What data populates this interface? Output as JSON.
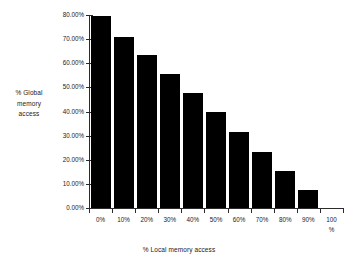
{
  "chart_data": {
    "type": "bar",
    "title": "",
    "xlabel": "% Local memory access",
    "ylabel": "% Global memory access",
    "ylabel_lines": [
      "% Global",
      "memory",
      "access"
    ],
    "categories": [
      "0%",
      "10%",
      "20%",
      "30%",
      "40%",
      "50%",
      "60%",
      "70%",
      "80%",
      "90%",
      "100\n%"
    ],
    "values": [
      79.7,
      71.0,
      63.5,
      55.5,
      47.7,
      39.6,
      31.7,
      23.4,
      15.5,
      7.5,
      0
    ],
    "ylim": [
      0,
      80
    ],
    "ytick_labels": [
      "0.00%",
      "10.00%",
      "20.00%",
      "30.00%",
      "40.00%",
      "50.00%",
      "60.00%",
      "70.00%",
      "80.00%"
    ],
    "ytick_values": [
      0,
      10,
      20,
      30,
      40,
      50,
      60,
      70,
      80
    ],
    "grid": false,
    "legend": "none",
    "bar_color": "#000000",
    "axis_color": "#2b2b2b",
    "background_color": "#ffffff"
  }
}
